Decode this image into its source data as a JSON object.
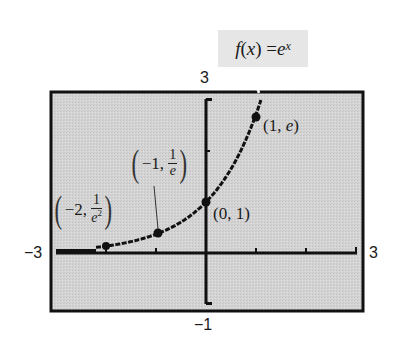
{
  "chart_data": {
    "type": "line",
    "title": "",
    "function_label": {
      "prefix": "f",
      "arg": "x",
      "equals": "=",
      "base": "e",
      "exponent": "x"
    },
    "xlabel": "",
    "ylabel": "",
    "xlim": [
      -3,
      3
    ],
    "ylim": [
      -1,
      3
    ],
    "window_labels": {
      "xmin": "−3",
      "xmax": "3",
      "ymin": "−1",
      "ymax": "3"
    },
    "x_ticks": [
      -3,
      -2,
      -1,
      0,
      1,
      2,
      3
    ],
    "y_ticks": [
      -1,
      0,
      1,
      2,
      3
    ],
    "grid": false,
    "legend": "none",
    "series": [
      {
        "name": "f(x) = e^x",
        "x": [
          -3,
          -2.5,
          -2,
          -1.5,
          -1,
          -0.5,
          0,
          0.5,
          1,
          1.0986
        ],
        "y": [
          0.05,
          0.08,
          0.135,
          0.223,
          0.368,
          0.607,
          1,
          1.649,
          2.718,
          3
        ]
      }
    ],
    "highlighted_points": [
      {
        "x": -2,
        "y": 0.135,
        "label_x": "−2",
        "label_num": "1",
        "label_den": "e",
        "label_den_exp": "2"
      },
      {
        "x": -1,
        "y": 0.368,
        "label_x": "−1",
        "label_num": "1",
        "label_den": "e",
        "label_den_exp": ""
      },
      {
        "x": 0,
        "y": 1,
        "label": "(0, 1)"
      },
      {
        "x": 1,
        "y": 2.718,
        "label": "(1, e)"
      }
    ],
    "colors": {
      "plot_background": "#d2d2d2",
      "frame": "#111111",
      "curve": "#111111",
      "label_box": "#e6e6e6",
      "text": "#1a1a1a"
    }
  },
  "labels": {
    "xmin": "−3",
    "xmax": "3",
    "ymax": "3",
    "ymin": "−1",
    "point_neg2": {
      "open": "(",
      "x": "−2,",
      "num": "1",
      "den": "e",
      "exp": "2",
      "close": ")"
    },
    "point_neg1": {
      "open": "(",
      "x": "−1,",
      "num": "1",
      "den": "e",
      "close": ")"
    },
    "point_0": "(0, 1)",
    "point_1_open": "(1, ",
    "point_1_e": "e",
    "point_1_close": ")",
    "fn": {
      "f": "f",
      "open": "(",
      "x": "x",
      "close": ") = ",
      "e": "e",
      "exp": "x"
    }
  }
}
